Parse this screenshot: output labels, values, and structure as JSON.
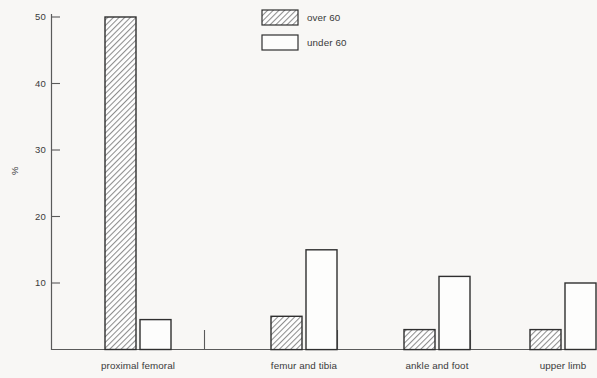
{
  "chart_data": {
    "type": "bar",
    "title": "",
    "subtitle": "",
    "xlabel": "",
    "ylabel": "%",
    "ylim": [
      0,
      52
    ],
    "yticks": [
      10,
      20,
      30,
      40,
      50
    ],
    "ytick_labels": [
      "10",
      "20",
      "30",
      "40",
      "50"
    ],
    "grid": false,
    "legend_position": "top-right",
    "categories": [
      "proximal femoral",
      "femur and tibia",
      "ankle and foot",
      "upper limb"
    ],
    "series": [
      {
        "name": "over 60",
        "fill": "hatched",
        "values": [
          50,
          5,
          3,
          3
        ]
      },
      {
        "name": "under 60",
        "fill": "white",
        "values": [
          4.5,
          15,
          11,
          10
        ]
      }
    ]
  },
  "axes": {
    "y_axis_label": "%",
    "y_tick_labels": [
      "50",
      "40",
      "30",
      "20",
      "10"
    ],
    "x_tick_labels": [
      "proximal femoral",
      "femur and tibia",
      "ankle and foot",
      "upper limb"
    ]
  },
  "legend": {
    "entries": [
      {
        "label": "over 60",
        "swatch": "hatched-swatch"
      },
      {
        "label": "under 60",
        "swatch": "white-swatch"
      }
    ]
  },
  "colors": {
    "background": "#f8f7f5",
    "axis": "#4a4a4a",
    "bar_outline": "#303030",
    "hatch_fill": "#b9b9b9",
    "white_fill": "#fdfdfc",
    "text": "#3a3a3a"
  }
}
